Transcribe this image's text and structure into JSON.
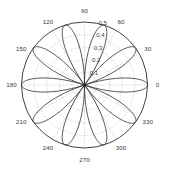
{
  "chart_data": {
    "type": "line",
    "subtype": "polar-rose",
    "title": "",
    "xlabel": "",
    "ylabel": "",
    "grid": true,
    "legend": null,
    "angle_unit": "degrees",
    "theta_direction": "counterclockwise",
    "theta_zero_location": "E",
    "rlim": [
      0,
      0.5
    ],
    "radial_ticks": [
      0.1,
      0.2,
      0.3,
      0.4,
      0.5
    ],
    "radial_tick_labels": [
      "0.1",
      "0.2",
      "0.3",
      "0.4",
      "0.5"
    ],
    "radial_tick_label_angle_deg": 80,
    "angular_ticks_deg": [
      0,
      30,
      60,
      90,
      120,
      150,
      180,
      210,
      240,
      270,
      300,
      330
    ],
    "angular_tick_labels": [
      "0",
      "30",
      "60",
      "90",
      "120",
      "150",
      "180",
      "210",
      "240",
      "270",
      "300",
      "330"
    ],
    "series": [
      {
        "name": "rose",
        "equation": "r = 0.5*abs(cos(5*theta))",
        "n_petals": 10,
        "petal_peak_radius": 0.5,
        "petal_half_width_deg": 18,
        "petal_peak_angles_deg": [
          0,
          36,
          72,
          108,
          144,
          180,
          216,
          252,
          288,
          324
        ],
        "color": "#2b2b2b",
        "linewidth": 0.8,
        "samples": 721
      }
    ],
    "colors": {
      "line": "#2b2b2b",
      "grid": "#9a9a9a",
      "outer_circle": "#2b2b2b",
      "text": "#3a3a3a",
      "background": "#ffffff"
    }
  },
  "figure": {
    "center_x": 84.5,
    "center_y": 85.0,
    "outer_radius": 63.0,
    "n_grid_circles": 5,
    "n_spokes": 12
  }
}
